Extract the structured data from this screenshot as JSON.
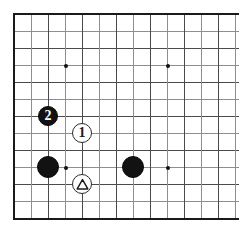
{
  "diagram": {
    "type": "go-board-diagram",
    "title": "",
    "board": {
      "visible_columns": 13,
      "visible_rows": 12,
      "origin_x": 14,
      "origin_y": 14,
      "spacing_x": 17,
      "spacing_y": 17,
      "background_color": "#ffffff",
      "grid_color": "#4a4a4a",
      "grid_color_faint": "#8e8e8e",
      "edge_color": "#1a1a1a",
      "cropped_edges": [
        "right"
      ]
    },
    "star_points": [
      {
        "name": "star-point-top-left",
        "col": 3,
        "row": 3
      },
      {
        "name": "star-point-top-right",
        "col": 9,
        "row": 3
      },
      {
        "name": "star-point-bottom-left",
        "col": 3,
        "row": 9
      },
      {
        "name": "star-point-bottom-right",
        "col": 9,
        "row": 9
      }
    ],
    "stones": [
      {
        "name": "black-stone-numbered-2",
        "color": "black",
        "col": 2,
        "row": 6,
        "radius": 10,
        "label": "2",
        "mark": "number"
      },
      {
        "name": "white-stone-numbered-1",
        "color": "white",
        "col": 4,
        "row": 7,
        "radius": 10,
        "label": "1",
        "mark": "number"
      },
      {
        "name": "black-stone-lower-left",
        "color": "black",
        "col": 2,
        "row": 9,
        "radius": 11,
        "label": "",
        "mark": "none"
      },
      {
        "name": "black-stone-lower-right",
        "color": "black",
        "col": 7,
        "row": 9,
        "radius": 11,
        "label": "",
        "mark": "none"
      },
      {
        "name": "white-stone-triangle-marked",
        "color": "white",
        "col": 4,
        "row": 10,
        "radius": 10,
        "label": "",
        "mark": "triangle"
      }
    ],
    "legend": {
      "black_move_number": "2",
      "white_move_number": "1",
      "triangle_mark_meaning": "marked white stone"
    }
  }
}
